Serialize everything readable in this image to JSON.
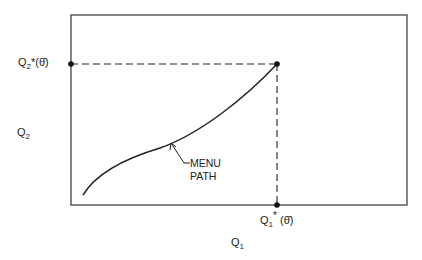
{
  "diagram": {
    "x_axis_label": "Q",
    "x_axis_sub": "1",
    "y_axis_label": "Q",
    "y_axis_sub": "2",
    "y_point_label": {
      "base": "Q",
      "sub": "2",
      "sup": "*",
      "arg": "(θ̄)"
    },
    "x_point_label": {
      "base": "Q",
      "sub": "1",
      "sup": "*",
      "arg": "(θ̄)"
    },
    "curve_annotation_line1": "MENU",
    "curve_annotation_line2": "PATH"
  }
}
